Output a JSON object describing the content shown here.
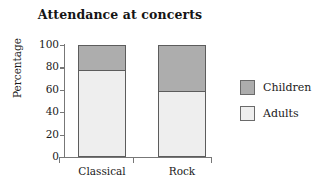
{
  "chart_data": {
    "type": "bar",
    "subtype": "stacked-bar-100-percent",
    "title": "Attendance at concerts",
    "xlabel": "",
    "ylabel": "Percentage",
    "categories": [
      "Classical",
      "Rock"
    ],
    "series": [
      {
        "name": "Adults",
        "values": [
          78,
          59
        ],
        "color": "#eeeeee"
      },
      {
        "name": "Children",
        "values": [
          22,
          41
        ],
        "color": "#adadad"
      }
    ],
    "ylim": [
      0,
      100
    ],
    "yticks": [
      0,
      20,
      40,
      60,
      80,
      100
    ],
    "ytick_labels": [
      "0",
      "20",
      "40",
      "60",
      "80",
      "100"
    ],
    "grid": false,
    "legend_position": "right",
    "stack_order_bottom_to_top": [
      "Adults",
      "Children"
    ]
  },
  "legend": {
    "entries": [
      {
        "label": "Children",
        "color": "#adadad"
      },
      {
        "label": "Adults",
        "color": "#eeeeee"
      }
    ]
  },
  "colors": {
    "children": "#adadad",
    "adults": "#eeeeee",
    "axis": "#777777",
    "bar_outline": "#5c5c5c",
    "text": "#1a1a1a",
    "background": "#ffffff"
  }
}
